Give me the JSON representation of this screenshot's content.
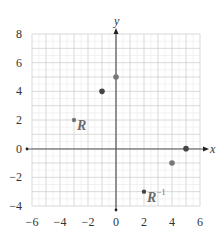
{
  "chart_data": {
    "type": "scatter",
    "title": "",
    "xlabel": "x",
    "ylabel": "y",
    "xlim": [
      -6,
      6
    ],
    "ylim": [
      -4,
      8
    ],
    "xticks": [
      -6,
      -4,
      -2,
      0,
      2,
      4,
      6
    ],
    "yticks": [
      -4,
      -2,
      0,
      2,
      4,
      6,
      8
    ],
    "xtick_labels": [
      "−6",
      "−4",
      "−2",
      "0",
      "2",
      "4",
      "6"
    ],
    "ytick_labels": [
      "−4",
      "−2",
      "0",
      "2",
      "4",
      "6",
      "8"
    ],
    "grid": true,
    "grid_minor_step": 1,
    "series": [
      {
        "name": "points",
        "points": [
          {
            "x": -3,
            "y": 2,
            "label": "R",
            "size": "small",
            "color": "#777777"
          },
          {
            "x": -1,
            "y": 4,
            "label": "",
            "size": "large",
            "color": "#444444"
          },
          {
            "x": 0,
            "y": 5,
            "label": "",
            "size": "large",
            "color": "#777777"
          },
          {
            "x": 5,
            "y": 0,
            "label": "",
            "size": "large",
            "color": "#444444"
          },
          {
            "x": 4,
            "y": -1,
            "label": "",
            "size": "large",
            "color": "#777777"
          },
          {
            "x": 2,
            "y": -3,
            "label": "R⁻¹",
            "size": "small",
            "color": "#444444"
          }
        ]
      }
    ],
    "annotations": [
      {
        "text": "R",
        "x": -3,
        "y": 2
      },
      {
        "text": "R",
        "superscript": "−1",
        "x": 2,
        "y": -3
      }
    ]
  },
  "labels": {
    "x_axis": "x",
    "y_axis": "y",
    "r_label": "R",
    "rinv_label": "R",
    "rinv_sup": "−1"
  },
  "colors": {
    "grid_minor": "#e4e4e4",
    "grid_major": "#cfcfcf",
    "axis": "#555555",
    "point_dark": "#444444",
    "point_light": "#777777"
  }
}
